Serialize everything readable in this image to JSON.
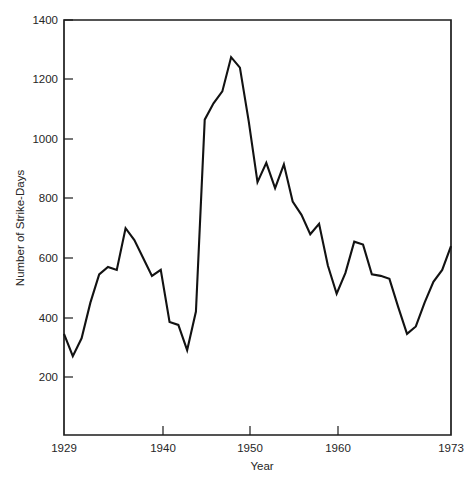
{
  "chart_data": {
    "type": "line",
    "title": "",
    "xlabel": "Year",
    "ylabel": "Number of Strike-Days",
    "xlim": [
      1929,
      1973
    ],
    "ylim": [
      0,
      1400
    ],
    "grid": false,
    "legend": "none",
    "x_ticks": [
      {
        "value": 1929,
        "label": "1929"
      },
      {
        "value": 1940,
        "label": "1940"
      },
      {
        "value": 1950,
        "label": "1950"
      },
      {
        "value": 1960,
        "label": "1960"
      },
      {
        "value": 1973,
        "label": "1973"
      }
    ],
    "y_ticks": [
      {
        "value": 200,
        "label": "200"
      },
      {
        "value": 400,
        "label": "400"
      },
      {
        "value": 600,
        "label": "600"
      },
      {
        "value": 800,
        "label": "800"
      },
      {
        "value": 1000,
        "label": "1000"
      },
      {
        "value": 1200,
        "label": "1200"
      },
      {
        "value": 1400,
        "label": "1400"
      }
    ],
    "x": [
      1929,
      1930,
      1931,
      1932,
      1933,
      1934,
      1935,
      1936,
      1937,
      1938,
      1939,
      1940,
      1941,
      1942,
      1943,
      1944,
      1945,
      1946,
      1947,
      1948,
      1949,
      1950,
      1951,
      1952,
      1953,
      1954,
      1955,
      1956,
      1957,
      1958,
      1959,
      1960,
      1961,
      1962,
      1963,
      1964,
      1965,
      1966,
      1967,
      1968,
      1969,
      1970,
      1971,
      1972,
      1973
    ],
    "values": [
      345,
      270,
      330,
      450,
      545,
      570,
      560,
      700,
      660,
      600,
      540,
      560,
      385,
      375,
      290,
      420,
      1065,
      1120,
      1160,
      1275,
      1240,
      1060,
      855,
      920,
      835,
      915,
      790,
      745,
      680,
      715,
      575,
      480,
      550,
      655,
      645,
      545,
      540,
      530,
      435,
      345,
      370,
      450,
      520,
      560,
      640
    ],
    "series": [
      {
        "name": "Number of Strike-Days",
        "color": "#121212",
        "values": [
          345,
          270,
          330,
          450,
          545,
          570,
          560,
          700,
          660,
          600,
          540,
          560,
          385,
          375,
          290,
          420,
          1065,
          1120,
          1160,
          1275,
          1240,
          1060,
          855,
          920,
          835,
          915,
          790,
          745,
          680,
          715,
          575,
          480,
          550,
          655,
          645,
          545,
          540,
          530,
          435,
          345,
          370,
          450,
          520,
          560,
          640
        ]
      }
    ],
    "points": [
      {
        "x": 1929,
        "y": 345
      },
      {
        "x": 1930,
        "y": 270
      },
      {
        "x": 1931,
        "y": 330
      },
      {
        "x": 1932,
        "y": 450
      },
      {
        "x": 1933,
        "y": 545
      },
      {
        "x": 1934,
        "y": 570
      },
      {
        "x": 1935,
        "y": 560
      },
      {
        "x": 1936,
        "y": 700
      },
      {
        "x": 1937,
        "y": 660
      },
      {
        "x": 1938,
        "y": 600
      },
      {
        "x": 1939,
        "y": 540
      },
      {
        "x": 1940,
        "y": 560
      },
      {
        "x": 1941,
        "y": 385
      },
      {
        "x": 1942,
        "y": 375
      },
      {
        "x": 1943,
        "y": 290
      },
      {
        "x": 1944,
        "y": 420
      },
      {
        "x": 1945,
        "y": 1065
      },
      {
        "x": 1946,
        "y": 1120
      },
      {
        "x": 1947,
        "y": 1160
      },
      {
        "x": 1948,
        "y": 1275
      },
      {
        "x": 1949,
        "y": 1240
      },
      {
        "x": 1950,
        "y": 1060
      },
      {
        "x": 1951,
        "y": 855
      },
      {
        "x": 1952,
        "y": 920
      },
      {
        "x": 1953,
        "y": 835
      },
      {
        "x": 1954,
        "y": 915
      },
      {
        "x": 1955,
        "y": 790
      },
      {
        "x": 1956,
        "y": 745
      },
      {
        "x": 1957,
        "y": 680
      },
      {
        "x": 1958,
        "y": 715
      },
      {
        "x": 1959,
        "y": 575
      },
      {
        "x": 1960,
        "y": 480
      },
      {
        "x": 1961,
        "y": 550
      },
      {
        "x": 1962,
        "y": 655
      },
      {
        "x": 1963,
        "y": 645
      },
      {
        "x": 1964,
        "y": 545
      },
      {
        "x": 1965,
        "y": 540
      },
      {
        "x": 1966,
        "y": 530
      },
      {
        "x": 1967,
        "y": 435
      },
      {
        "x": 1968,
        "y": 345
      },
      {
        "x": 1969,
        "y": 370
      },
      {
        "x": 1970,
        "y": 450
      },
      {
        "x": 1971,
        "y": 520
      },
      {
        "x": 1972,
        "y": 560
      },
      {
        "x": 1973,
        "y": 640
      }
    ],
    "annotations": [],
    "colors": {
      "line": "#121212",
      "frame": "#1c1c1c",
      "text": "#262626",
      "background": "#ffffff"
    }
  }
}
